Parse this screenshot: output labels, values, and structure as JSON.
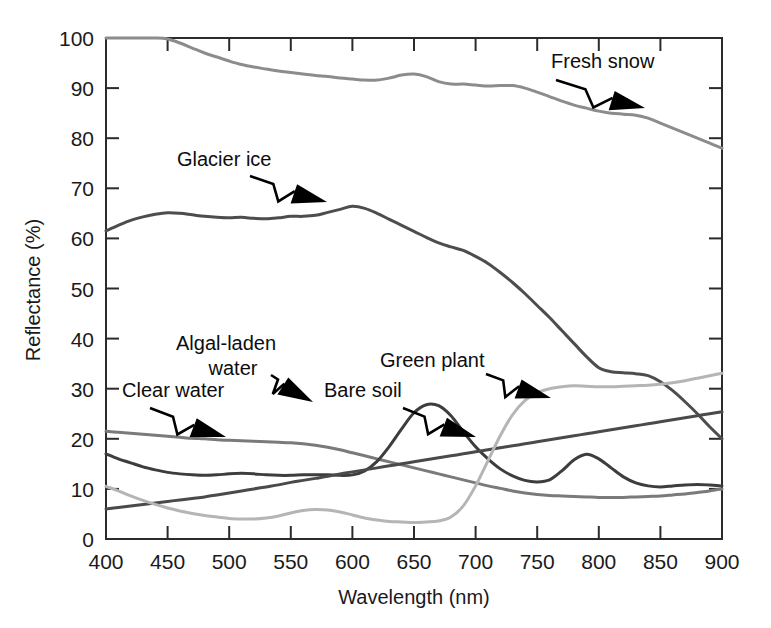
{
  "chart_data": {
    "type": "line",
    "title": "",
    "xlabel": "Wavelength (nm)",
    "ylabel": "Reflectance (%)",
    "xlim": [
      400,
      900
    ],
    "ylim": [
      0,
      100
    ],
    "xticks": [
      400,
      450,
      500,
      550,
      600,
      650,
      700,
      750,
      800,
      850,
      900
    ],
    "yticks": [
      0,
      10,
      20,
      30,
      40,
      50,
      60,
      70,
      80,
      90,
      100
    ],
    "grid": false,
    "legend": "inline-annotations",
    "x": [
      400,
      410,
      420,
      430,
      440,
      450,
      460,
      470,
      480,
      490,
      500,
      510,
      520,
      530,
      540,
      550,
      560,
      570,
      580,
      590,
      600,
      610,
      620,
      630,
      640,
      650,
      660,
      670,
      680,
      690,
      700,
      710,
      720,
      730,
      740,
      750,
      760,
      770,
      780,
      790,
      800,
      810,
      820,
      830,
      840,
      850,
      860,
      870,
      880,
      890,
      900
    ],
    "series": [
      {
        "name": "Fresh snow",
        "color": "#8c8c8c",
        "width": 3.0,
        "values": [
          100,
          100,
          100,
          100,
          100,
          99.8,
          99.0,
          98.0,
          97.0,
          96.2,
          95.4,
          94.7,
          94.2,
          93.8,
          93.4,
          93.1,
          92.8,
          92.5,
          92.3,
          92.0,
          91.8,
          91.6,
          91.6,
          92.0,
          92.6,
          92.8,
          92.3,
          91.3,
          90.8,
          90.8,
          90.6,
          90.4,
          90.5,
          90.5,
          90.0,
          89.2,
          88.3,
          87.4,
          86.6,
          86.0,
          85.4,
          85.0,
          84.8,
          84.6,
          84.0,
          83.0,
          82.0,
          81.0,
          80.0,
          79.0,
          78.0
        ]
      },
      {
        "name": "Glacier ice",
        "color": "#4d4d4d",
        "width": 3.0,
        "values": [
          61.5,
          62.6,
          63.6,
          64.3,
          64.8,
          65.1,
          65.0,
          64.7,
          64.4,
          64.2,
          64.1,
          64.2,
          64.0,
          63.9,
          64.1,
          64.4,
          64.4,
          64.6,
          65.2,
          65.8,
          66.4,
          66.0,
          65.0,
          63.8,
          62.6,
          61.4,
          60.2,
          59.1,
          58.3,
          57.6,
          56.4,
          55.0,
          53.2,
          51.2,
          49.0,
          46.6,
          44.2,
          41.6,
          39.0,
          36.4,
          34.2,
          33.4,
          33.2,
          33.0,
          32.6,
          31.4,
          29.6,
          27.4,
          25.0,
          22.4,
          20.0
        ]
      },
      {
        "name": "Clear water",
        "color": "#7a7a7a",
        "width": 3.0,
        "values": [
          21.5,
          21.3,
          21.1,
          20.9,
          20.7,
          20.5,
          20.3,
          20.1,
          20.0,
          19.8,
          19.7,
          19.6,
          19.5,
          19.4,
          19.3,
          19.2,
          19.0,
          18.7,
          18.3,
          17.8,
          17.2,
          16.6,
          16.0,
          15.4,
          14.8,
          14.2,
          13.6,
          13.0,
          12.4,
          11.8,
          11.2,
          10.6,
          10.1,
          9.6,
          9.2,
          8.9,
          8.7,
          8.6,
          8.5,
          8.4,
          8.3,
          8.3,
          8.3,
          8.4,
          8.5,
          8.6,
          8.8,
          9.0,
          9.3,
          9.6,
          10.0
        ]
      },
      {
        "name": "Algal-laden water",
        "color": "#3d3d3d",
        "width": 3.0,
        "values": [
          17.0,
          16.0,
          15.2,
          14.4,
          13.8,
          13.3,
          13.0,
          12.8,
          12.7,
          12.8,
          13.0,
          13.1,
          13.0,
          12.8,
          12.7,
          12.7,
          12.8,
          12.8,
          12.8,
          12.7,
          12.8,
          13.6,
          15.5,
          18.5,
          22.0,
          25.2,
          26.8,
          26.6,
          24.6,
          21.4,
          18.4,
          16.0,
          14.0,
          12.6,
          11.7,
          11.4,
          11.8,
          13.6,
          15.8,
          16.9,
          16.0,
          14.2,
          12.4,
          11.2,
          10.6,
          10.4,
          10.6,
          10.8,
          10.9,
          10.8,
          10.6
        ]
      },
      {
        "name": "Bare soil",
        "color": "#4a4a4a",
        "width": 3.0,
        "values": [
          6.0,
          6.3,
          6.6,
          6.9,
          7.2,
          7.5,
          7.8,
          8.1,
          8.4,
          8.8,
          9.2,
          9.6,
          10.0,
          10.4,
          10.8,
          11.3,
          11.7,
          12.1,
          12.5,
          13.0,
          13.4,
          13.8,
          14.2,
          14.6,
          15.0,
          15.4,
          15.8,
          16.2,
          16.6,
          17.0,
          17.4,
          17.8,
          18.2,
          18.6,
          19.0,
          19.4,
          19.8,
          20.2,
          20.6,
          21.0,
          21.4,
          21.8,
          22.2,
          22.6,
          23.0,
          23.4,
          23.8,
          24.2,
          24.6,
          25.0,
          25.4
        ]
      },
      {
        "name": "Green plant",
        "color": "#b5b5b5",
        "width": 3.0,
        "values": [
          10.5,
          9.6,
          8.6,
          7.7,
          6.9,
          6.2,
          5.6,
          5.1,
          4.7,
          4.4,
          4.1,
          4.0,
          4.0,
          4.2,
          4.6,
          5.2,
          5.7,
          5.9,
          5.8,
          5.4,
          4.8,
          4.2,
          3.8,
          3.5,
          3.4,
          3.3,
          3.4,
          3.6,
          4.4,
          6.6,
          10.6,
          15.6,
          20.6,
          24.8,
          27.6,
          29.2,
          30.0,
          30.4,
          30.6,
          30.5,
          30.4,
          30.4,
          30.5,
          30.6,
          30.7,
          30.9,
          31.2,
          31.6,
          32.1,
          32.6,
          33.1
        ]
      }
    ],
    "annotations": [
      {
        "id": "fresh-snow",
        "label": "Fresh snow",
        "lines": [
          "Fresh snow"
        ],
        "text_x": 551,
        "text_y": 68,
        "arrow_from": [
          556,
          80
        ],
        "arrow_to": [
          645,
          108
        ]
      },
      {
        "id": "glacier-ice",
        "label": "Glacier ice",
        "lines": [
          "Glacier ice"
        ],
        "text_x": 177,
        "text_y": 166,
        "arrow_from": [
          250,
          176
        ],
        "arrow_to": [
          327,
          202
        ]
      },
      {
        "id": "algal-laden-water",
        "label": "Algal-laden water",
        "lines": [
          "Algal-laden",
          "water"
        ],
        "text_x": 176,
        "text_y": 350,
        "arrow_from": [
          271,
          375
        ],
        "arrow_to": [
          313,
          402
        ]
      },
      {
        "id": "clear-water",
        "label": "Clear water",
        "lines": [
          "Clear water"
        ],
        "text_x": 122,
        "text_y": 397,
        "arrow_from": [
          150,
          408
        ],
        "arrow_to": [
          226,
          437
        ]
      },
      {
        "id": "bare-soil",
        "label": "Bare soil",
        "lines": [
          "Bare soil"
        ],
        "text_x": 324,
        "text_y": 397,
        "arrow_from": [
          403,
          408
        ],
        "arrow_to": [
          476,
          437
        ]
      },
      {
        "id": "green-plant",
        "label": "Green plant",
        "lines": [
          "Green plant"
        ],
        "text_x": 380,
        "text_y": 367,
        "arrow_from": [
          486,
          374
        ],
        "arrow_to": [
          551,
          398
        ]
      }
    ]
  },
  "axes": {
    "y_title": "Reflectance (%)",
    "x_title": "Wavelength (nm)",
    "y_tick_labels": [
      "0",
      "10",
      "20",
      "30",
      "40",
      "50",
      "60",
      "70",
      "80",
      "90",
      "100"
    ],
    "x_tick_labels": [
      "400",
      "450",
      "500",
      "550",
      "600",
      "650",
      "700",
      "750",
      "800",
      "850",
      "900"
    ]
  },
  "colors": {
    "axis": "#2b2b2b",
    "text": "#1a1a1a",
    "background": "#ffffff",
    "fresh_snow": "#8c8c8c",
    "glacier_ice": "#4d4d4d",
    "clear_water": "#7a7a7a",
    "algal_laden_water": "#3d3d3d",
    "bare_soil": "#4a4a4a",
    "green_plant": "#b5b5b5"
  }
}
